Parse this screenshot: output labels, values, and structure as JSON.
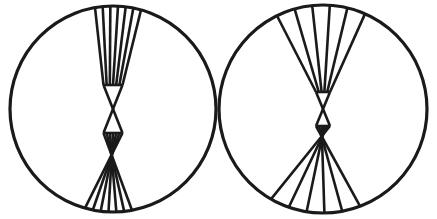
{
  "canvas": {
    "width": 437,
    "height": 219,
    "background_color": "#ffffff",
    "stroke_color": "#1a1a1a",
    "title": "Two circles with fanned chord bundles"
  },
  "figures": [
    {
      "id": "left-figure",
      "name": "left-circle-figure",
      "circle": {
        "cx": 113,
        "cy": 109,
        "r": 103,
        "stroke_width": 3.2,
        "fill": "none",
        "stroke_color": "#1a1a1a"
      },
      "bowtie": {
        "description": "narrow hourglass bundle of chords crossing near centre",
        "waist_top_y": 85,
        "waist_bottom_y": 133,
        "waist_half_width": 9.5,
        "line_count_top": 7,
        "line_count_bottom": 7,
        "stroke_width": 2.6,
        "top_span_x": [
          95,
          141
        ],
        "bottom_span_x": [
          85,
          132
        ],
        "top_y": 7,
        "bottom_y": 206,
        "spread": "narrow"
      }
    },
    {
      "id": "right-figure",
      "name": "right-circle-figure",
      "circle": {
        "cx": 323,
        "cy": 109,
        "r": 104,
        "stroke_width": 3.2,
        "fill": "none",
        "stroke_color": "#1a1a1a"
      },
      "bowtie": {
        "description": "wider splayed hourglass bundle of chords crossing near centre",
        "waist_top_y": 92,
        "waist_bottom_y": 126,
        "waist_half_width": 7,
        "line_count_top": 6,
        "line_count_bottom": 6,
        "stroke_width": 2.6,
        "top_span_x": [
          277,
          365
        ],
        "bottom_span_x": [
          271,
          360
        ],
        "top_y": 10,
        "bottom_y": 203,
        "spread": "wide"
      }
    }
  ]
}
